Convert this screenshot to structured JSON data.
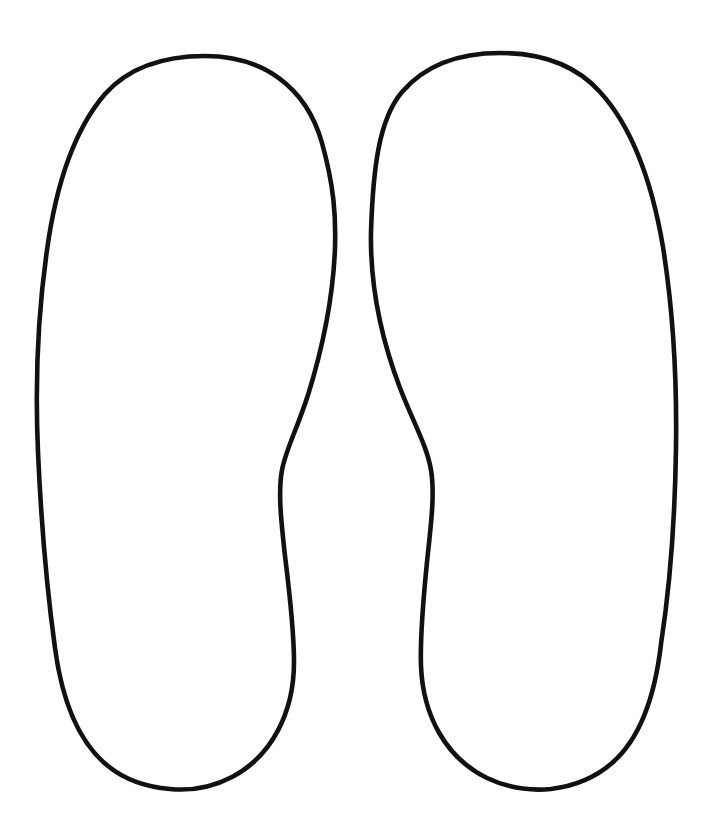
{
  "document": {
    "kind": "line-art-outline-template",
    "subject": "pair-of-shoe-sole-footprint-outlines",
    "width": 713,
    "height": 829,
    "background_color": "#ffffff",
    "stroke_color": "#111111",
    "stroke_width": 4.6,
    "fill_color": "#ffffff",
    "text_present": "none"
  },
  "shapes": {
    "left": {
      "name": "left-sole-outline",
      "side_label": "left",
      "bounds": {
        "x_min": 38,
        "x_max": 336,
        "y_min": 54,
        "y_max": 791
      },
      "toe_apex": {
        "x": 205,
        "y": 56
      },
      "heel_apex": {
        "x": 170,
        "y": 789
      },
      "widest_outer": {
        "x": 38,
        "y": 380
      },
      "widest_toe_inner": {
        "x": 335,
        "y": 246
      },
      "arch_inflection": {
        "x": 281,
        "y": 457
      },
      "path": "M 205 56 C 262 56 306 86 322 143 C 334 186 336 216 335 248 C 333 300 322 350 308 395 C 296 432 286 449 282 470 C 278 492 281 520 285 556 C 290 596 294 634 294 662 C 294 712 272 756 232 777 C 213 787 191 791 170 789 C 146 787 124 779 108 766 C 78 742 62 700 55 648 C 47 590 41 520 38 452 C 35 384 38 313 47 250 C 56 185 74 130 105 94 C 130 66 166 56 205 56 Z"
    },
    "right": {
      "name": "right-sole-outline",
      "side_label": "right",
      "bounds": {
        "x_min": 371,
        "x_max": 676,
        "y_min": 51,
        "y_max": 789
      },
      "toe_apex": {
        "x": 500,
        "y": 53
      },
      "heel_apex": {
        "x": 537,
        "y": 787
      },
      "widest_outer": {
        "x": 676,
        "y": 372
      },
      "widest_toe_inner": {
        "x": 371,
        "y": 232
      },
      "arch_inflection": {
        "x": 437,
        "y": 462
      },
      "path": "M 500 53 C 461 53 426 64 402 92 C 379 119 373 168 371 232 C 370 286 381 338 400 388 C 414 424 427 446 431 470 C 435 494 431 524 427 562 C 423 602 420 638 421 666 C 423 716 446 758 487 778 C 508 788 530 791 551 789 C 575 786 596 777 612 763 C 641 738 655 696 661 644 C 670 586 675 516 676 448 C 677 380 673 310 663 247 C 652 182 632 127 600 92 C 575 64 539 53 500 53 Z"
    }
  },
  "layout": {
    "arrangement": "side-by-side-mirrored-pair",
    "gap_between_shapes_px": 36,
    "canvas_margin_top_px": 51,
    "canvas_margin_bottom_px": 38
  }
}
